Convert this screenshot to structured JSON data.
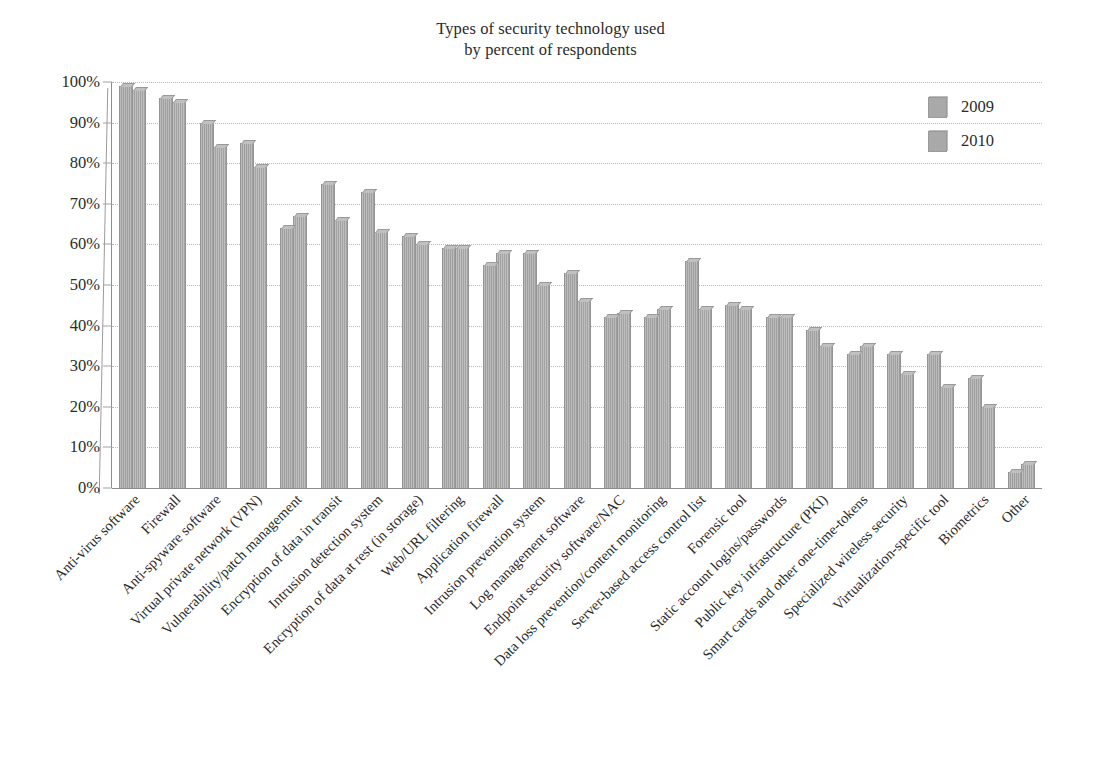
{
  "chart_data": {
    "type": "bar",
    "title": "Types of security technology used by percent of respondents",
    "title_lines": [
      "Types of security technology used",
      "by percent of respondents"
    ],
    "xlabel": "",
    "ylabel": "",
    "ylim": [
      0,
      100
    ],
    "y_unit": "%",
    "grid": true,
    "legend_position": "top-right",
    "bar_color": "#a8a8a8",
    "categories": [
      "Anti-virus software",
      "Firewall",
      "Anti-spyware software",
      "Virtual private network (VPN)",
      "Vulnerability/patch management",
      "Encryption of data in transit",
      "Intrusion detection system",
      "Encryption of data at rest (in storage)",
      "Web/URL filtering",
      "Application firewall",
      "Intrusion prevention system",
      "Log management software",
      "Endpoint security software/NAC",
      "Data loss prevention/content monitoring",
      "Server-based access control list",
      "Forensic tool",
      "Static account logins/passwords",
      "Public key infrastructure (PKI)",
      "Smart cards and other one-time-tokens",
      "Specialized wireless security",
      "Virtualization-specific tool",
      "Biometrics",
      "Other"
    ],
    "series": [
      {
        "name": "2009",
        "values": [
          99,
          96,
          90,
          85,
          64,
          75,
          73,
          62,
          59,
          55,
          58,
          53,
          42,
          42,
          56,
          45,
          42,
          39,
          33,
          33,
          33,
          27,
          4
        ]
      },
      {
        "name": "2010",
        "values": [
          98,
          95,
          84,
          79,
          67,
          66,
          63,
          60,
          59,
          58,
          50,
          46,
          43,
          44,
          44,
          44,
          42,
          35,
          35,
          28,
          25,
          20,
          6
        ]
      }
    ],
    "y_ticks": [
      "0%",
      "10%",
      "20%",
      "30%",
      "40%",
      "50%",
      "60%",
      "70%",
      "80%",
      "90%",
      "100%"
    ],
    "y_tick_values": [
      0,
      10,
      20,
      30,
      40,
      50,
      60,
      70,
      80,
      90,
      100
    ]
  },
  "legend": {
    "items": [
      {
        "label": "2009",
        "color": "#a9a9a9"
      },
      {
        "label": "2010",
        "color": "#a9a9a9"
      }
    ]
  }
}
